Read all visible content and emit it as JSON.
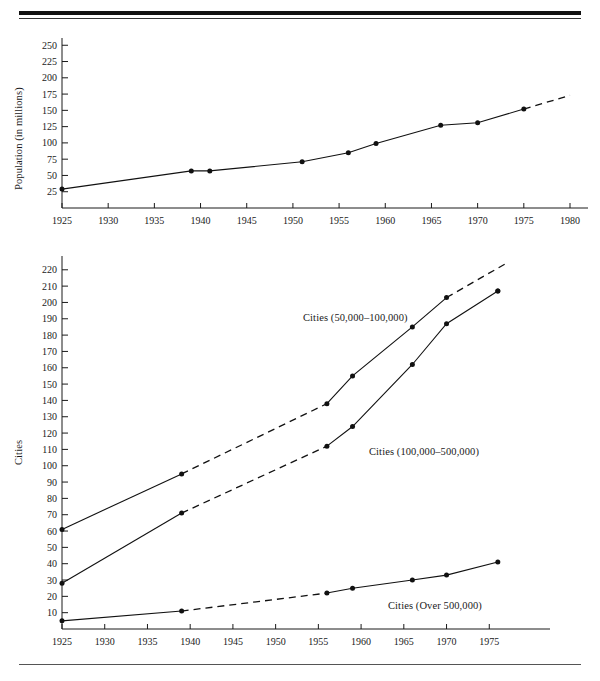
{
  "document": {
    "rules": {
      "top_thick": true,
      "top_thin": true,
      "bottom": true
    }
  },
  "chart_data": [
    {
      "id": "population",
      "type": "line",
      "title": "",
      "xlabel": "",
      "ylabel": "Population (in millions)",
      "xlim": [
        1925,
        1980
      ],
      "ylim": [
        0,
        255
      ],
      "xticks": [
        1925,
        1930,
        1935,
        1940,
        1945,
        1950,
        1955,
        1960,
        1965,
        1970,
        1975,
        1980
      ],
      "xtick_labels": [
        "1925",
        "1930",
        "1935",
        "1940",
        "1945",
        "1950",
        "1955",
        "1960",
        "1965",
        "1970",
        "1975",
        "1980"
      ],
      "yticks": [
        25,
        50,
        75,
        100,
        125,
        150,
        175,
        200,
        225,
        250
      ],
      "ytick_labels": [
        "25",
        "50",
        "75",
        "100",
        "125",
        "150",
        "175",
        "200",
        "225",
        "250"
      ],
      "grid": false,
      "legend": "none",
      "series": [
        {
          "name": "Population",
          "style": "solid",
          "x": [
            1925,
            1939,
            1941,
            1951,
            1956,
            1959,
            1966,
            1970,
            1975
          ],
          "values": [
            29,
            57,
            57,
            71,
            85,
            99,
            127,
            131,
            152
          ],
          "extrapolation": {
            "style": "dashed",
            "x": [
              1975,
              1980
            ],
            "values": [
              152,
              173
            ]
          }
        }
      ]
    },
    {
      "id": "cities",
      "type": "line",
      "title": "",
      "xlabel": "",
      "ylabel": "Cities",
      "xlim": [
        1925,
        1980
      ],
      "ylim": [
        0,
        226
      ],
      "xticks": [
        1925,
        1930,
        1935,
        1940,
        1945,
        1950,
        1955,
        1960,
        1965,
        1970,
        1975
      ],
      "xtick_labels": [
        "1925",
        "1930",
        "1935",
        "1940",
        "1945",
        "1950",
        "1955",
        "1960",
        "1965",
        "1970",
        "1975"
      ],
      "yticks": [
        10,
        20,
        30,
        40,
        50,
        60,
        70,
        80,
        90,
        100,
        110,
        120,
        130,
        140,
        150,
        160,
        170,
        180,
        190,
        200,
        210,
        220
      ],
      "ytick_labels": [
        "10",
        "20",
        "30",
        "40",
        "50",
        "60",
        "70",
        "80",
        "90",
        "100",
        "110",
        "120",
        "130",
        "140",
        "150",
        "160",
        "170",
        "180",
        "190",
        "200",
        "210",
        "220"
      ],
      "grid": false,
      "legend": "inline-annotations",
      "series": [
        {
          "name": "Cities (50,000–100,000)",
          "label": "Cities (50,000–100,000)",
          "style": "solid-with-dashed-gaps",
          "x": [
            1925,
            1939,
            1956,
            1959,
            1966,
            1970,
            1976
          ],
          "values": [
            61,
            95,
            138,
            155,
            185,
            203,
            207
          ],
          "dashed_segments": [
            {
              "x": [
                1939,
                1956
              ],
              "values": [
                95,
                138
              ]
            },
            {
              "x": [
                1970,
                1977
              ],
              "values": [
                203,
                224
              ]
            }
          ]
        },
        {
          "name": "Cities (100,000–500,000)",
          "label": "Cities (100,000–500,000)",
          "style": "solid-with-dashed-gaps",
          "x": [
            1925,
            1939,
            1956,
            1959,
            1966,
            1970,
            1976
          ],
          "values": [
            28,
            71,
            112,
            124,
            162,
            187,
            207
          ],
          "dashed_segments": [
            {
              "x": [
                1939,
                1956
              ],
              "values": [
                71,
                112
              ]
            }
          ]
        },
        {
          "name": "Cities (Over 500,000)",
          "label": "Cities (Over 500,000)",
          "style": "solid-with-dashed-gaps",
          "x": [
            1925,
            1939,
            1956,
            1959,
            1966,
            1970,
            1976
          ],
          "values": [
            5,
            11,
            22,
            25,
            30,
            33,
            41
          ],
          "dashed_segments": [
            {
              "x": [
                1939,
                1956
              ],
              "values": [
                11,
                22
              ]
            }
          ]
        }
      ]
    }
  ]
}
